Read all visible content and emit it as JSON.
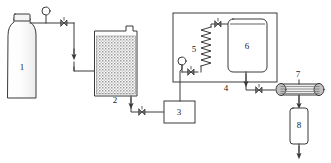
{
  "diagram": {
    "background": "#ffffff",
    "line_color": "#3a3a3a",
    "fill_color": "#f2f2f2",
    "label_color": "#1a1a1a",
    "components": [
      {
        "id": "1",
        "label": "1",
        "name": "gas-cylinder",
        "label_x": 22,
        "label_y": 68
      },
      {
        "id": "2",
        "label": "2",
        "name": "packed-bed-vessel",
        "label_x": 115,
        "label_y": 101
      },
      {
        "id": "3",
        "label": "3",
        "name": "pump-box",
        "label_x": 179,
        "label_y": 114
      },
      {
        "id": "4",
        "label": "4",
        "name": "heating-enclosure",
        "label_x": 226,
        "label_y": 88
      },
      {
        "id": "5",
        "label": "5",
        "name": "heating-coil",
        "label_x": 194,
        "label_y": 50
      },
      {
        "id": "6",
        "label": "6",
        "name": "reactor-vessel",
        "label_x": 246,
        "label_y": 47
      },
      {
        "id": "7",
        "label": "7",
        "name": "condenser",
        "label_x": 297,
        "label_y": 74
      },
      {
        "id": "8",
        "label": "8",
        "name": "collection-vessel",
        "label_x": 299,
        "label_y": 126
      }
    ]
  }
}
